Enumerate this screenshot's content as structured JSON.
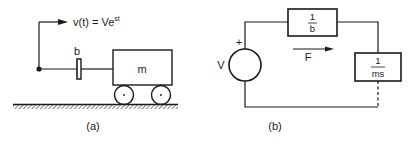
{
  "figure_a": {
    "caption": "(a)",
    "velocity_label": "v(t) = Ve",
    "velocity_exponent": "st",
    "damper_label": "b",
    "mass_label": "m"
  },
  "figure_b": {
    "caption": "(b)",
    "source_label": "V",
    "source_polarity": "+",
    "current_label": "F",
    "impedance_1": {
      "numerator": "1",
      "denominator": "b"
    },
    "impedance_2": {
      "numerator": "1",
      "denominator": "ms"
    }
  },
  "colors": {
    "line": "#1a1a1a",
    "background": "#ffffff"
  }
}
